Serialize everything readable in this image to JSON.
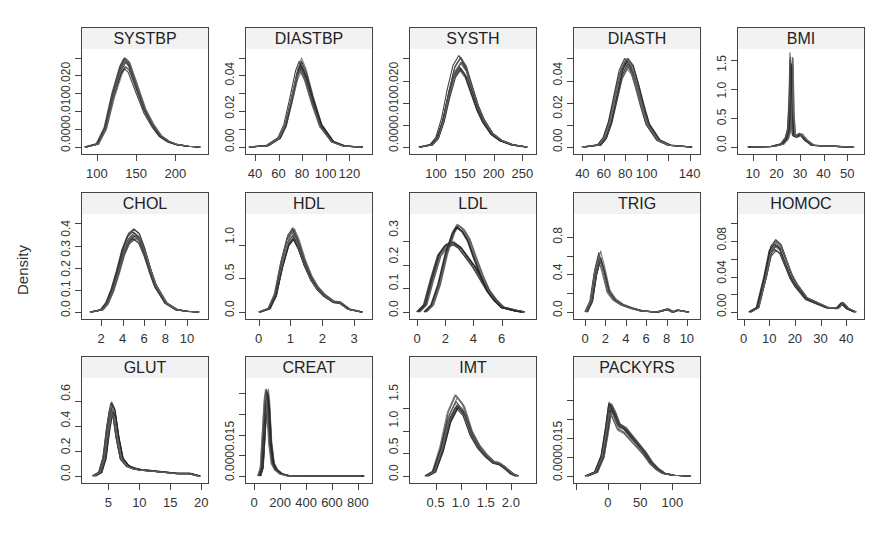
{
  "chart_data": {
    "type": "line",
    "title": "",
    "ylabel": "Density",
    "layout": {
      "rows": 3,
      "cols": 5,
      "panels": 14
    },
    "panels": [
      {
        "name": "SYSTBP",
        "xlim": [
          85,
          235
        ],
        "ylim": [
          0,
          0.026
        ],
        "xticks": [
          100,
          150,
          200
        ],
        "xtick_labels": [
          "100",
          "150",
          "200"
        ],
        "yticks": [
          0,
          0.005,
          0.01,
          0.015,
          0.02,
          0.025
        ],
        "ytick_labels": [
          "0.000",
          "0.010",
          "0.020"
        ],
        "peak_x": 135,
        "peak_y": 0.023,
        "x": [
          85,
          100,
          110,
          120,
          130,
          135,
          140,
          150,
          160,
          170,
          180,
          190,
          200,
          215,
          230
        ],
        "y": [
          0.0,
          0.0008,
          0.005,
          0.014,
          0.021,
          0.023,
          0.022,
          0.016,
          0.01,
          0.006,
          0.003,
          0.0015,
          0.0007,
          0.0002,
          0.0
        ]
      },
      {
        "name": "DIASTBP",
        "xlim": [
          35,
          135
        ],
        "ylim": [
          0,
          0.052
        ],
        "xticks": [
          40,
          60,
          80,
          100,
          120
        ],
        "xtick_labels": [
          "40",
          "60",
          "80",
          "100",
          "120"
        ],
        "yticks": [
          0,
          0.01,
          0.02,
          0.03,
          0.04,
          0.05
        ],
        "ytick_labels": [
          "0.00",
          "0.02",
          "0.04"
        ],
        "peak_x": 78,
        "peak_y": 0.046,
        "x": [
          35,
          50,
          60,
          65,
          70,
          75,
          78,
          82,
          88,
          95,
          105,
          115,
          130
        ],
        "y": [
          0.0,
          0.0008,
          0.005,
          0.012,
          0.026,
          0.041,
          0.046,
          0.04,
          0.026,
          0.012,
          0.003,
          0.0005,
          0.0
        ]
      },
      {
        "name": "SYSTH",
        "xlim": [
          60,
          265
        ],
        "ylim": [
          0,
          0.021
        ],
        "xticks": [
          100,
          150,
          200,
          250
        ],
        "xtick_labels": [
          "100",
          "150",
          "200",
          "250"
        ],
        "yticks": [
          0,
          0.005,
          0.01,
          0.015,
          0.02
        ],
        "ytick_labels": [
          "0.000",
          "0.010",
          "0.020"
        ],
        "peak_x": 140,
        "peak_y": 0.019,
        "x": [
          70,
          90,
          100,
          110,
          120,
          130,
          140,
          150,
          160,
          170,
          180,
          195,
          210,
          230,
          255
        ],
        "y": [
          0.0,
          0.0005,
          0.002,
          0.006,
          0.012,
          0.017,
          0.019,
          0.017,
          0.013,
          0.009,
          0.006,
          0.003,
          0.0015,
          0.0005,
          0.0
        ]
      },
      {
        "name": "DIASTH",
        "xlim": [
          35,
          145
        ],
        "ylim": [
          0,
          0.042
        ],
        "xticks": [
          40,
          60,
          80,
          100,
          120,
          140
        ],
        "xtick_labels": [
          "40",
          "60",
          "80",
          "100",
          "",
          "140"
        ],
        "yticks": [
          0,
          0.01,
          0.02,
          0.03,
          0.04
        ],
        "ytick_labels": [
          "0.00",
          "0.02",
          "0.04"
        ],
        "peak_x": 80,
        "peak_y": 0.038,
        "x": [
          40,
          55,
          60,
          65,
          70,
          75,
          80,
          85,
          90,
          95,
          100,
          110,
          120,
          140
        ],
        "y": [
          0.0,
          0.001,
          0.004,
          0.011,
          0.022,
          0.033,
          0.038,
          0.035,
          0.027,
          0.018,
          0.01,
          0.003,
          0.0008,
          0.0
        ]
      },
      {
        "name": "BMI",
        "xlim": [
          5,
          55
        ],
        "ylim": [
          0,
          1.6
        ],
        "xticks": [
          10,
          20,
          30,
          40,
          50
        ],
        "xtick_labels": [
          "10",
          "20",
          "30",
          "40",
          "50"
        ],
        "yticks": [
          0,
          0.5,
          1.0,
          1.5
        ],
        "ytick_labels": [
          "0.0",
          "0.5",
          "1.0",
          "1.5"
        ],
        "peak_x": 26,
        "peak_y": 1.5,
        "x": [
          8,
          18,
          22,
          24,
          25,
          25.6,
          26,
          26.4,
          27,
          28,
          30,
          32,
          35,
          45,
          52
        ],
        "y": [
          0.0,
          0.01,
          0.05,
          0.15,
          0.3,
          0.8,
          1.5,
          0.6,
          0.2,
          0.18,
          0.22,
          0.12,
          0.03,
          0.01,
          0.0
        ]
      },
      {
        "name": "CHOL",
        "xlim": [
          0.5,
          11.5
        ],
        "ylim": [
          0,
          0.42
        ],
        "xticks": [
          2,
          4,
          6,
          8,
          10
        ],
        "xtick_labels": [
          "2",
          "4",
          "6",
          "8",
          "10"
        ],
        "yticks": [
          0,
          0.1,
          0.2,
          0.3,
          0.4
        ],
        "ytick_labels": [
          "0.0",
          "0.1",
          "0.2",
          "0.3",
          "0.4"
        ],
        "peak_x": 5,
        "peak_y": 0.35,
        "x": [
          1,
          2,
          2.5,
          3,
          3.5,
          4,
          4.5,
          5,
          5.5,
          6,
          6.5,
          7,
          8,
          9,
          10,
          11
        ],
        "y": [
          0.0,
          0.01,
          0.04,
          0.1,
          0.18,
          0.27,
          0.33,
          0.35,
          0.33,
          0.27,
          0.19,
          0.12,
          0.04,
          0.01,
          0.003,
          0.0
        ]
      },
      {
        "name": "HDL",
        "xlim": [
          -0.3,
          3.4
        ],
        "ylim": [
          0,
          1.38
        ],
        "xticks": [
          0,
          1,
          2,
          3
        ],
        "xtick_labels": [
          "0",
          "1",
          "2",
          "3"
        ],
        "yticks": [
          0,
          0.5,
          1.0
        ],
        "ytick_labels": [
          "0.0",
          "0.5",
          "1.0"
        ],
        "peak_x": 1.05,
        "peak_y": 1.15,
        "x": [
          0,
          0.3,
          0.5,
          0.7,
          0.9,
          1.05,
          1.2,
          1.4,
          1.6,
          1.8,
          2.0,
          2.3,
          2.5,
          2.8,
          3.2
        ],
        "y": [
          0.0,
          0.05,
          0.25,
          0.7,
          1.05,
          1.15,
          1.0,
          0.72,
          0.5,
          0.35,
          0.25,
          0.15,
          0.14,
          0.04,
          0.0
        ]
      },
      {
        "name": "LDL",
        "xlim": [
          -0.3,
          8.1
        ],
        "ylim": [
          0,
          0.395
        ],
        "xticks": [
          0,
          2,
          4,
          6
        ],
        "xtick_labels": [
          "0",
          "2",
          "4",
          "6"
        ],
        "yticks": [
          0,
          0.1,
          0.2,
          0.3
        ],
        "ytick_labels": [
          "0.0",
          "0.1",
          "0.2",
          "0.3"
        ],
        "series": [
          {
            "name": "imputed-A",
            "peak_x": 2.5,
            "peak_y": 0.29,
            "x": [
              0,
              0.5,
              1,
              1.5,
              2,
              2.5,
              3,
              3.5,
              4,
              4.5,
              5,
              5.5,
              6,
              7,
              7.5
            ],
            "y": [
              0.0,
              0.03,
              0.14,
              0.24,
              0.28,
              0.29,
              0.27,
              0.23,
              0.19,
              0.14,
              0.09,
              0.05,
              0.02,
              0.005,
              0.0
            ]
          },
          {
            "name": "imputed-B",
            "peak_x": 2.8,
            "peak_y": 0.37,
            "x": [
              0.5,
              1,
              1.5,
              2,
              2.5,
              2.8,
              3.2,
              3.6,
              4,
              4.5,
              5,
              5.5,
              6,
              7,
              7.5
            ],
            "y": [
              0.0,
              0.03,
              0.12,
              0.25,
              0.34,
              0.37,
              0.35,
              0.31,
              0.24,
              0.16,
              0.09,
              0.05,
              0.02,
              0.005,
              0.0
            ]
          }
        ]
      },
      {
        "name": "TRIG",
        "xlim": [
          -0.8,
          10.8
        ],
        "ylim": [
          0,
          0.99
        ],
        "xticks": [
          0,
          2,
          4,
          6,
          8,
          10
        ],
        "xtick_labels": [
          "0",
          "2",
          "4",
          "6",
          "8",
          "10"
        ],
        "yticks": [
          0,
          0.2,
          0.4,
          0.6,
          0.8
        ],
        "ytick_labels": [
          "0.0",
          "0.4",
          "0.8"
        ],
        "peak_x": 1.3,
        "peak_y": 0.6,
        "x": [
          0,
          0.5,
          0.9,
          1.3,
          1.7,
          2.2,
          2.8,
          3.5,
          4.5,
          5.5,
          7,
          8,
          8.5,
          9,
          10
        ],
        "y": [
          0.0,
          0.12,
          0.42,
          0.6,
          0.45,
          0.22,
          0.13,
          0.08,
          0.04,
          0.01,
          0.0,
          0.03,
          0.0,
          0.02,
          0.0
        ]
      },
      {
        "name": "HOMOC",
        "xlim": [
          -1,
          45
        ],
        "ylim": [
          0,
          0.105
        ],
        "xticks": [
          0,
          10,
          20,
          30,
          40
        ],
        "xtick_labels": [
          "0",
          "10",
          "20",
          "30",
          "40"
        ],
        "yticks": [
          0,
          0.02,
          0.04,
          0.06,
          0.08,
          0.1
        ],
        "ytick_labels": [
          "0.00",
          "0.04",
          "0.08"
        ],
        "peak_x": 12,
        "peak_y": 0.075,
        "x": [
          2,
          5,
          8,
          10,
          12,
          14,
          16,
          18,
          20,
          24,
          28,
          32,
          36,
          38,
          40,
          43
        ],
        "y": [
          0.0,
          0.005,
          0.04,
          0.068,
          0.075,
          0.07,
          0.055,
          0.04,
          0.03,
          0.015,
          0.01,
          0.005,
          0.004,
          0.01,
          0.004,
          0.0
        ]
      },
      {
        "name": "GLUT",
        "xlim": [
          1.2,
          20.3
        ],
        "ylim": [
          0,
          0.74
        ],
        "xticks": [
          5,
          10,
          15,
          20
        ],
        "xtick_labels": [
          "5",
          "10",
          "15",
          "20"
        ],
        "yticks": [
          0,
          0.2,
          0.4,
          0.6
        ],
        "ytick_labels": [
          "0.0",
          "0.2",
          "0.4",
          "0.6"
        ],
        "peak_x": 5.3,
        "peak_y": 0.55,
        "x": [
          2.5,
          3.5,
          4.2,
          4.8,
          5.3,
          5.8,
          6.3,
          7,
          8,
          9,
          10,
          12,
          14,
          16,
          18,
          19.5
        ],
        "y": [
          0.0,
          0.03,
          0.15,
          0.4,
          0.55,
          0.5,
          0.32,
          0.14,
          0.08,
          0.06,
          0.05,
          0.04,
          0.03,
          0.02,
          0.02,
          0.0
        ]
      },
      {
        "name": "CREAT",
        "xlim": [
          -40,
          870
        ],
        "ylim": [
          0,
          0.0225
        ],
        "xticks": [
          0,
          200,
          400,
          600,
          800
        ],
        "xtick_labels": [
          "0",
          "200",
          "400",
          "600",
          "800"
        ],
        "yticks": [
          0,
          0.005,
          0.01,
          0.015,
          0.02
        ],
        "ytick_labels": [
          "0.000",
          "",
          "0.015"
        ],
        "peak_x": 90,
        "peak_y": 0.02,
        "x": [
          30,
          50,
          65,
          80,
          90,
          100,
          115,
          135,
          160,
          200,
          250,
          400,
          600,
          830
        ],
        "y": [
          0.0,
          0.002,
          0.01,
          0.018,
          0.02,
          0.017,
          0.008,
          0.003,
          0.0015,
          0.0005,
          0.0001,
          0.0,
          0.0,
          0.0
        ]
      },
      {
        "name": "IMT",
        "xlim": [
          0.05,
          2.4
        ],
        "ylim": [
          0,
          2.05
        ],
        "xticks": [
          0.5,
          1.0,
          1.5,
          2.0
        ],
        "xtick_labels": [
          "0.5",
          "1.0",
          "1.5",
          "2.0"
        ],
        "yticks": [
          0,
          0.5,
          1.0,
          1.5
        ],
        "ytick_labels": [
          "0.0",
          "0.5",
          "1.0",
          "1.5"
        ],
        "peak_x": 0.9,
        "peak_y": 1.65,
        "x": [
          0.3,
          0.45,
          0.6,
          0.75,
          0.9,
          1.05,
          1.2,
          1.35,
          1.5,
          1.65,
          1.75,
          1.85,
          2.0,
          2.1
        ],
        "y": [
          0.0,
          0.1,
          0.6,
          1.3,
          1.65,
          1.45,
          0.95,
          0.65,
          0.45,
          0.3,
          0.28,
          0.2,
          0.05,
          0.0
        ]
      },
      {
        "name": "PACKYRS",
        "xlim": [
          -48,
          135
        ],
        "ylim": [
          0,
          0.0245
        ],
        "xticks": [
          -50,
          0,
          50,
          100
        ],
        "xtick_labels": [
          "",
          "0",
          "50",
          "100"
        ],
        "yticks": [
          0,
          0.005,
          0.01,
          0.015,
          0.02
        ],
        "ytick_labels": [
          "0.000",
          "",
          "0.015"
        ],
        "peak_x": 2,
        "peak_y": 0.018,
        "x": [
          -35,
          -20,
          -10,
          -3,
          2,
          8,
          15,
          25,
          35,
          45,
          55,
          65,
          75,
          85,
          100,
          125
        ],
        "y": [
          0.0,
          0.001,
          0.005,
          0.012,
          0.018,
          0.016,
          0.013,
          0.012,
          0.01,
          0.008,
          0.006,
          0.0035,
          0.0018,
          0.0007,
          0.0002,
          0.0
        ]
      }
    ]
  }
}
